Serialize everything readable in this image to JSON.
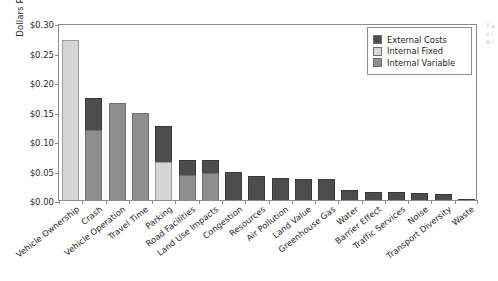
{
  "chart_data": {
    "type": "bar",
    "stacked": true,
    "title": "",
    "xlabel": "",
    "ylabel": "Dollars Per Vehicle Mile",
    "ylim": [
      0,
      0.3
    ],
    "ytick_values": [
      0.0,
      0.05,
      0.1,
      0.15,
      0.2,
      0.25,
      0.3
    ],
    "ytick_labels": [
      "$0.00",
      "$0.05",
      "$0.10",
      "$0.15",
      "$0.20",
      "$0.25",
      "$0.30"
    ],
    "grid": false,
    "legend_position": "top-right",
    "categories": [
      "Vehicle Ownership",
      "Crash",
      "Vehicle Operation",
      "Travel Time",
      "Parking",
      "Road Facilities",
      "Land Use Impacts",
      "Congestion",
      "Resources",
      "Air Pollution",
      "Land Value",
      "Greenhouse Gas",
      "Water",
      "Barrier Effect",
      "Traffic Services",
      "Noise",
      "Transport Diversity",
      "Waste"
    ],
    "series": [
      {
        "name": "External Costs",
        "color": "#4d4d4d",
        "values": [
          0.0,
          0.055,
          0.0,
          0.0,
          0.061,
          0.024,
          0.022,
          0.047,
          0.04,
          0.038,
          0.036,
          0.035,
          0.017,
          0.013,
          0.013,
          0.012,
          0.011,
          0.002
        ]
      },
      {
        "name": "Internal Fixed",
        "color": "#d6d6d6",
        "values": [
          0.272,
          0.0,
          0.0,
          0.0,
          0.065,
          0.0,
          0.0,
          0.0,
          0.0,
          0.0,
          0.0,
          0.0,
          0.0,
          0.0,
          0.0,
          0.0,
          0.0,
          0.0
        ]
      },
      {
        "name": "Internal Variable",
        "color": "#8e8e8e",
        "values": [
          0.0,
          0.118,
          0.165,
          0.148,
          0.0,
          0.043,
          0.045,
          0.0,
          0.0,
          0.0,
          0.0,
          0.0,
          0.0,
          0.0,
          0.0,
          0.0,
          0.0,
          0.0
        ]
      }
    ],
    "totals": [
      0.272,
      0.173,
      0.165,
      0.148,
      0.126,
      0.067,
      0.067,
      0.047,
      0.04,
      0.038,
      0.036,
      0.035,
      0.017,
      0.013,
      0.013,
      0.012,
      0.011,
      0.002
    ]
  },
  "legend": {
    "items": [
      {
        "label": "External Costs",
        "color": "#4d4d4d"
      },
      {
        "label": "Internal Fixed",
        "color": "#d6d6d6"
      },
      {
        "label": "Internal Variable",
        "color": "#8e8e8e"
      }
    ]
  }
}
